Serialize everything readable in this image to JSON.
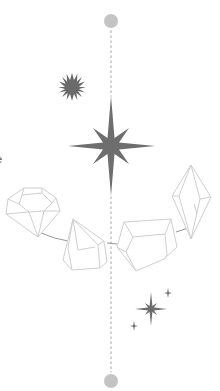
{
  "illustration": {
    "description": "Vertical dotted timeline with gem crystals and sparkles",
    "edge_text_fragment": "e",
    "colors": {
      "background": "#ffffff",
      "timeline_dot": "#bdbdbd",
      "endpoint_circle": "#c4c4c4",
      "star_fill": "#6e6e6e",
      "sunburst_fill": "#6a6a6a",
      "crystal_stroke": "#cfcfcf",
      "connector_stroke": "#8a8a8a"
    },
    "timeline": {
      "x": 111,
      "top_circle": {
        "cx": 111,
        "cy": 21,
        "r": 7
      },
      "bottom_circle": {
        "cx": 111,
        "cy": 381,
        "r": 7
      }
    },
    "icons": [
      "sunburst-icon",
      "eight-point-star-icon",
      "round-gem-icon",
      "pyramid-crystal-icon",
      "prism-crystal-icon",
      "elongated-crystal-icon",
      "sparkle-cluster-icon"
    ]
  }
}
